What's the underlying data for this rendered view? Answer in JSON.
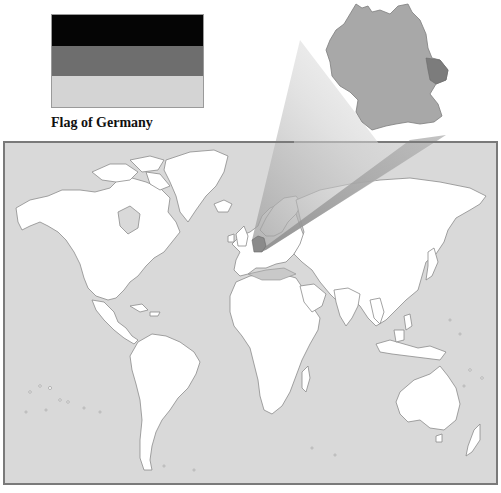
{
  "flag": {
    "caption": "Flag of Germany",
    "stripes": [
      {
        "name": "black",
        "color": "#050505"
      },
      {
        "name": "red",
        "color": "#6e6e6e"
      },
      {
        "name": "gold",
        "color": "#d4d4d4"
      }
    ]
  },
  "map": {
    "title": "World map highlighting Germany",
    "highlighted_country": "Germany",
    "colors": {
      "ocean": "#d9d9d9",
      "land": "#ffffff",
      "border": "#8c8c8c",
      "frame": "#7a7a7a",
      "highlight": "#a8a8a8",
      "highlight_dark": "#8a8a8a",
      "mediterranean_tint": "#c9c9c9"
    },
    "inset": {
      "label": "Enlarged Germany"
    }
  }
}
